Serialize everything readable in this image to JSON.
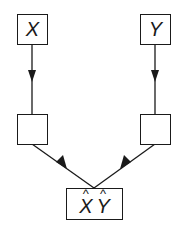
{
  "diagram": {
    "type": "flow",
    "nodes": [
      {
        "id": "x",
        "label": "X"
      },
      {
        "id": "y",
        "label": "Y"
      },
      {
        "id": "left-mid",
        "label": ""
      },
      {
        "id": "right-mid",
        "label": ""
      },
      {
        "id": "out",
        "label_parts": [
          "X",
          "Y"
        ],
        "decoration": "hat"
      }
    ],
    "edges": [
      {
        "from": "x",
        "to": "left-mid"
      },
      {
        "from": "y",
        "to": "right-mid"
      },
      {
        "from": "left-mid",
        "to": "out"
      },
      {
        "from": "right-mid",
        "to": "out"
      }
    ],
    "colors": {
      "stroke": "#1a1a1a",
      "background": "#ffffff"
    }
  }
}
